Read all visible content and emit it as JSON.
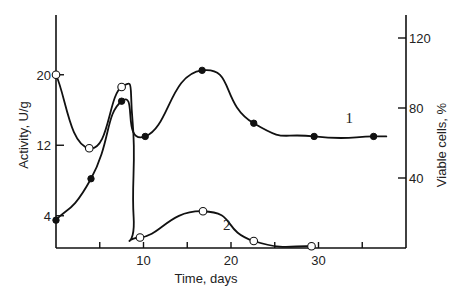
{
  "chart_data": {
    "type": "line",
    "title": "",
    "xlabel": "Time, days",
    "ylabel": "Activity, U/g",
    "y2label": "Viable cells, %",
    "xlim": [
      0,
      40
    ],
    "ylim": [
      0,
      28
    ],
    "y2lim": [
      0,
      140
    ],
    "x_ticks": [
      0,
      5,
      10,
      15,
      20,
      25,
      30,
      35
    ],
    "x_tick_labels": [
      "10",
      "20",
      "30"
    ],
    "x_tick_label_values": [
      10,
      20,
      30
    ],
    "y_tick_labels": [
      "4",
      "12",
      "20"
    ],
    "y_tick_values": [
      4,
      12,
      20
    ],
    "y2_tick_labels": [
      "40",
      "80",
      "120"
    ],
    "y2_tick_values": [
      40,
      80,
      120
    ],
    "grid": false,
    "series": [
      {
        "name": "1",
        "axis": "left",
        "marker": "filled-circle",
        "x": [
          0,
          4,
          7.5,
          10.2,
          16.7,
          22.6,
          29.5,
          36.3
        ],
        "values": [
          3.5,
          8.2,
          17,
          13,
          20.5,
          14.5,
          13,
          13
        ]
      },
      {
        "name": "2",
        "axis": "right",
        "marker": "open-circle",
        "x": [
          0,
          3.8,
          7.5,
          9.6,
          16.8,
          22.6,
          29.2
        ],
        "values": [
          99,
          57,
          92,
          6,
          21,
          4,
          1
        ]
      }
    ],
    "annotations": [
      {
        "text": "1",
        "x": 33.5,
        "y": 14.5,
        "axis": "left"
      },
      {
        "text": "2",
        "x": 19.5,
        "y": 2.4,
        "axis": "left"
      }
    ]
  }
}
